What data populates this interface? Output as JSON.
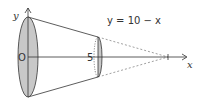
{
  "diagram": {
    "equation_label": "y = 10 − x",
    "y_axis_label": "y",
    "x_axis_label": "x",
    "origin_label": "O",
    "tick_label": "5",
    "colors": {
      "stroke": "#333333",
      "fill": "#c8c8c8",
      "dashed": "#777777"
    }
  }
}
